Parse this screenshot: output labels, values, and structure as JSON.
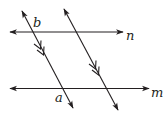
{
  "diagram": {
    "type": "parallel-lines-transversals",
    "lines": [
      {
        "id": "n",
        "label": "n",
        "orientation": "horizontal"
      },
      {
        "id": "m",
        "label": "m",
        "orientation": "horizontal"
      },
      {
        "id": "t1",
        "label": "",
        "orientation": "transversal",
        "parallel_marks": 2
      },
      {
        "id": "t2",
        "label": "",
        "orientation": "transversal",
        "parallel_marks": 2
      }
    ],
    "labels": {
      "n": "n",
      "m": "m",
      "a": "a",
      "b": "b"
    },
    "colors": {
      "stroke": "#231f20",
      "background": "#ffffff"
    }
  }
}
